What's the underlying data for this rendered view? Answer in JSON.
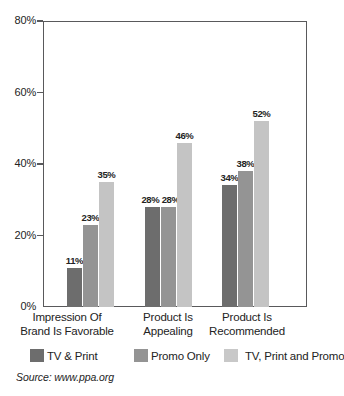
{
  "chart_data": {
    "type": "bar",
    "title": "",
    "subtitle": "",
    "xlabel": "",
    "ylabel": "",
    "ylim": [
      0,
      80
    ],
    "y_ticks": [
      "0%",
      "20%",
      "40%",
      "60%",
      "80%"
    ],
    "y_tick_values": [
      0,
      20,
      40,
      60,
      80
    ],
    "grid": false,
    "legend_position": "bottom",
    "categories": [
      "Impression Of Brand Is Favorable",
      "Product Is Appealing",
      "Product Is Recommended"
    ],
    "category_lines": [
      [
        "Impression Of",
        "Brand Is Favorable"
      ],
      [
        "Product Is",
        "Appealing"
      ],
      [
        "Product Is",
        "Recommended"
      ]
    ],
    "series": [
      {
        "name": "TV & Print",
        "color": "#6d6d6d",
        "values": [
          11,
          28,
          34
        ],
        "labels": [
          "11%",
          "28%",
          "34%"
        ]
      },
      {
        "name": "Promo Only",
        "color": "#949494",
        "values": [
          23,
          28,
          38
        ],
        "labels": [
          "23%",
          "28%",
          "38%"
        ]
      },
      {
        "name": "TV, Print and Promo",
        "color": "#c4c4c4",
        "values": [
          35,
          46,
          52
        ],
        "labels": [
          "35%",
          "46%",
          "52%"
        ]
      }
    ],
    "annotations": {
      "source": "Source: www.ppa.org"
    }
  },
  "legend": [
    {
      "label": "TV & Print",
      "color": "#6d6d6d"
    },
    {
      "label": "Promo Only",
      "color": "#949494"
    },
    {
      "label": "TV, Print and Promo",
      "color": "#c4c4c4"
    }
  ],
  "axis": {
    "y_ticks": [
      "0%",
      "20%",
      "40%",
      "60%",
      "80%"
    ]
  },
  "footer": {
    "source": "Source: www.ppa.org"
  }
}
